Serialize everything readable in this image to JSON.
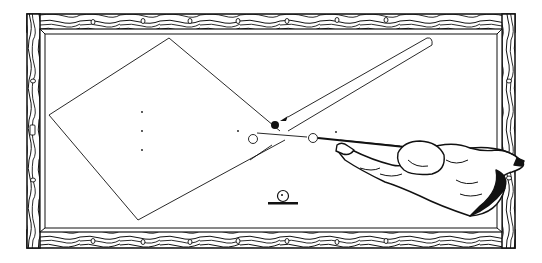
{
  "illustration": {
    "subject": "Overhead view of a billiard table with player shooting",
    "colors": {
      "background": "#ffffff",
      "ink": "#111111",
      "cloth": "#ffffff"
    },
    "table": {
      "outer": {
        "x": 27,
        "y": 14,
        "w": 488,
        "h": 234
      },
      "inner": {
        "x": 44,
        "y": 32,
        "w": 454,
        "h": 200
      },
      "rail_diamonds_top_x": [
        93,
        143,
        190,
        238,
        287,
        337,
        386
      ],
      "rail_diamonds_bottom_x": [
        93,
        143,
        190,
        238,
        287,
        337,
        386
      ],
      "rail_diamonds_left_y": [
        81,
        178
      ],
      "rail_diamonds_right_y": [
        81,
        178
      ]
    },
    "path": {
      "label": "Ball path (rotated square)",
      "points": [
        [
          169,
          38
        ],
        [
          49,
          115
        ],
        [
          138,
          220
        ],
        [
          280,
          131
        ]
      ]
    },
    "balls": {
      "object_ball_black": {
        "cx": 275,
        "cy": 125,
        "r": 4
      },
      "white_ball_1": {
        "cx": 253,
        "cy": 139,
        "r": 4.5
      },
      "white_ball_2": {
        "cx": 313,
        "cy": 138,
        "r": 4.5
      }
    },
    "spots": [
      [
        142,
        112
      ],
      [
        142,
        131
      ],
      [
        142,
        150
      ],
      [
        238,
        131
      ],
      [
        336,
        132
      ]
    ],
    "legend_symbol": {
      "label": "ball on table symbol",
      "cx": 283,
      "cy": 197
    }
  }
}
